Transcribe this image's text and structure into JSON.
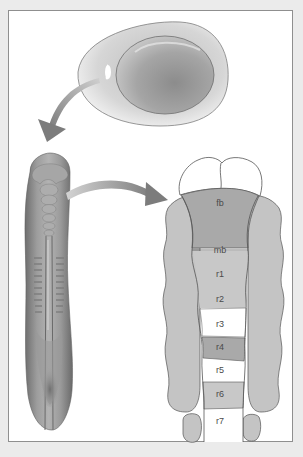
{
  "figure": {
    "panels": [
      {
        "name": "egg",
        "description": "fertilized egg with embryo disc"
      },
      {
        "name": "embryo",
        "description": "early neural-tube stage embryo, dorsal view"
      },
      {
        "name": "brain-segments",
        "description": "segmented neural tube: forebrain, midbrain, rhombomeres"
      }
    ],
    "arrows": [
      {
        "from": "egg",
        "to": "embryo"
      },
      {
        "from": "embryo",
        "to": "brain-segments"
      }
    ],
    "segments": [
      {
        "id": "fb",
        "label": "fb",
        "shade": "#a9a9a9"
      },
      {
        "id": "mb",
        "label": "mb",
        "shade": "#a9a9a9"
      },
      {
        "id": "r1",
        "label": "r1",
        "shade": "#c8c8c8"
      },
      {
        "id": "r2",
        "label": "r2",
        "shade": "#c8c8c8"
      },
      {
        "id": "r3",
        "label": "r3",
        "shade": "#ffffff"
      },
      {
        "id": "r4",
        "label": "r4",
        "shade": "#a9a9a9"
      },
      {
        "id": "r5",
        "label": "r5",
        "shade": "#ffffff"
      },
      {
        "id": "r6",
        "label": "r6",
        "shade": "#c8c8c8"
      },
      {
        "id": "r7",
        "label": "r7",
        "shade": "#ffffff"
      }
    ]
  },
  "colors": {
    "page_bg": "#ebebeb",
    "frame_border": "#8f8f8f",
    "tissue_gray": "#c4c4c4",
    "dark_gray": "#a9a9a9",
    "arrow_gray": "#8a8a8a",
    "outline": "#555555"
  }
}
